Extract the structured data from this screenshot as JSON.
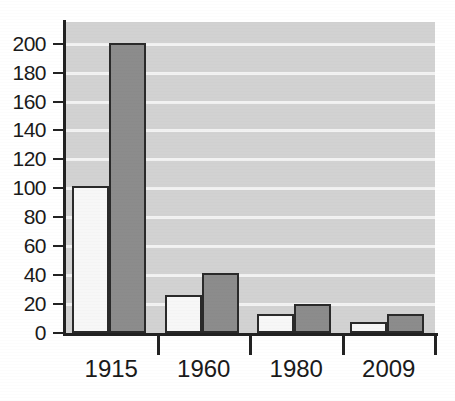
{
  "chart_data": {
    "type": "bar",
    "title": "",
    "subtitle": "",
    "xlabel": "",
    "ylabel": "",
    "categories": [
      "1915",
      "1960",
      "1980",
      "2009"
    ],
    "series": [
      {
        "name": "light-series",
        "values": [
          100,
          25,
          12,
          6
        ],
        "color": "#f7f7f7"
      },
      {
        "name": "dark-series",
        "values": [
          199,
          40,
          19,
          12
        ],
        "color": "#8c8c8c"
      }
    ],
    "ylim": [
      0,
      215
    ],
    "yticks": [
      0,
      20,
      40,
      60,
      80,
      100,
      120,
      140,
      160,
      180,
      200
    ],
    "ytick_labels": [
      "0",
      "20",
      "40",
      "60",
      "80",
      "100",
      "120",
      "140",
      "160",
      "180",
      "200"
    ],
    "grid": true,
    "grid_color": "#f2f2f2",
    "plot_background": "#d2d2d2",
    "axis_color": "#222222",
    "legend": null,
    "legend_position": "none",
    "annotations": []
  },
  "colors": {
    "page_background": "#ffffff",
    "plot_background": "#d2d2d2",
    "gridline": "#f2f2f2",
    "axis": "#222222",
    "bar_light": "#f7f7f7",
    "bar_dark": "#8c8c8c",
    "bar_outline": "#2a2a2a",
    "text": "#1a1a1a"
  }
}
